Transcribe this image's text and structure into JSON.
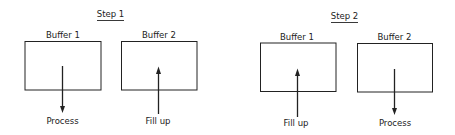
{
  "steps": [
    {
      "title": "Step 1",
      "buffers": [
        {
          "label": "Buffer 1",
          "action": "Process",
          "direction": "down"
        },
        {
          "label": "Buffer 2",
          "action": "Fill up",
          "direction": "up"
        }
      ]
    },
    {
      "title": "Step 2",
      "buffers": [
        {
          "label": "Buffer 1",
          "action": "Fill up",
          "direction": "up"
        },
        {
          "label": "Buffer 2",
          "action": "Process",
          "direction": "down"
        }
      ]
    }
  ],
  "colors": {
    "ink": "#222222",
    "background": "#ffffff"
  }
}
